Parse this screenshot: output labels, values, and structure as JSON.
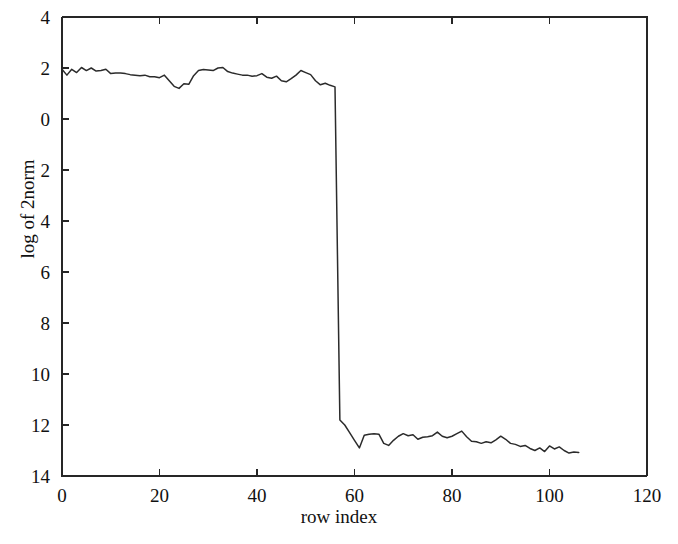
{
  "chart_data": {
    "type": "line",
    "title": "",
    "xlabel": "row index",
    "ylabel": "log of 2norm",
    "xlim": [
      0,
      120
    ],
    "ylim": [
      -14,
      4
    ],
    "xticks": [
      0,
      20,
      40,
      60,
      80,
      100,
      120
    ],
    "xtick_labels": [
      "0",
      "20",
      "40",
      "60",
      "80",
      "100",
      "120"
    ],
    "yticks": [
      4,
      2,
      0,
      -2,
      -4,
      -6,
      -8,
      -10,
      -12,
      -14
    ],
    "ytick_labels": [
      "4",
      "2",
      "0",
      "2",
      "4",
      "6",
      "8",
      "10",
      "12",
      "14"
    ],
    "grid": false,
    "legend": null,
    "line_color": "#2b2b2b",
    "series": [
      {
        "name": "log of 2norm",
        "x": [
          0,
          1,
          2,
          3,
          4,
          5,
          6,
          7,
          8,
          9,
          10,
          11,
          12,
          13,
          14,
          15,
          16,
          17,
          18,
          19,
          20,
          21,
          22,
          23,
          24,
          25,
          26,
          27,
          28,
          29,
          30,
          31,
          32,
          33,
          34,
          35,
          36,
          37,
          38,
          39,
          40,
          41,
          42,
          43,
          44,
          45,
          46,
          47,
          48,
          49,
          50,
          51,
          52,
          53,
          54,
          55,
          56,
          57,
          58,
          59,
          60,
          61,
          62,
          63,
          64,
          65,
          66,
          67,
          68,
          69,
          70,
          71,
          72,
          73,
          74,
          75,
          76,
          77,
          78,
          79,
          80,
          81,
          82,
          83,
          84,
          85,
          86,
          87,
          88,
          89,
          90,
          91,
          92,
          93,
          94,
          95,
          96,
          97,
          98,
          99,
          100,
          101,
          102,
          103,
          104,
          105,
          106
        ],
        "y": [
          1.95,
          1.72,
          1.95,
          1.82,
          2.02,
          1.9,
          2.0,
          1.88,
          1.9,
          1.95,
          1.78,
          1.8,
          1.8,
          1.78,
          1.74,
          1.72,
          1.7,
          1.72,
          1.66,
          1.66,
          1.62,
          1.72,
          1.5,
          1.28,
          1.2,
          1.38,
          1.36,
          1.7,
          1.9,
          1.94,
          1.92,
          1.9,
          2.0,
          2.02,
          1.86,
          1.8,
          1.76,
          1.72,
          1.72,
          1.68,
          1.7,
          1.78,
          1.64,
          1.6,
          1.68,
          1.5,
          1.46,
          1.58,
          1.72,
          1.9,
          1.82,
          1.74,
          1.5,
          1.34,
          1.4,
          1.32,
          1.26,
          -11.8,
          -12.0,
          -12.3,
          -12.6,
          -12.9,
          -12.4,
          -12.36,
          -12.34,
          -12.36,
          -12.72,
          -12.8,
          -12.6,
          -12.44,
          -12.34,
          -12.42,
          -12.38,
          -12.56,
          -12.48,
          -12.46,
          -12.42,
          -12.28,
          -12.44,
          -12.5,
          -12.44,
          -12.34,
          -12.24,
          -12.46,
          -12.64,
          -12.66,
          -12.72,
          -12.66,
          -12.7,
          -12.58,
          -12.44,
          -12.56,
          -12.72,
          -12.76,
          -12.84,
          -12.8,
          -12.92,
          -13.0,
          -12.9,
          -13.04,
          -12.82,
          -12.94,
          -12.86,
          -13.0,
          -13.1,
          -13.06,
          -13.08
        ]
      }
    ]
  }
}
